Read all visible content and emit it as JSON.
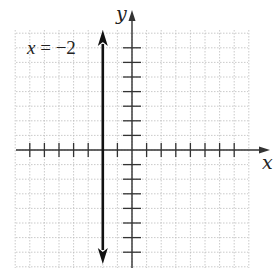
{
  "chart_data": {
    "type": "line",
    "title": "",
    "xlabel": "x",
    "ylabel": "y",
    "xlim": [
      -8,
      8
    ],
    "ylim": [
      -8,
      8
    ],
    "grid": true,
    "annotation": "x = −2",
    "series": [
      {
        "name": "x = −2",
        "kind": "vertical-line",
        "x": -2,
        "y_range": [
          -8,
          8
        ],
        "arrows": "both"
      }
    ],
    "x_ticks_unlabeled": [
      -7,
      -6,
      -5,
      -4,
      -3,
      -2,
      -1,
      1,
      2,
      3,
      4,
      5,
      6,
      7
    ],
    "y_ticks_unlabeled": [
      -7,
      -6,
      -5,
      -4,
      -3,
      -2,
      -1,
      1,
      2,
      3,
      4,
      5,
      6,
      7
    ]
  },
  "labels": {
    "x_axis": "x",
    "y_axis": "y",
    "equation": "x = −2"
  }
}
